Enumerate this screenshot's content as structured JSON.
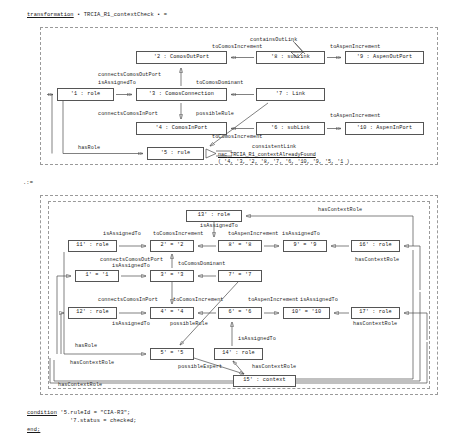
{
  "header": {
    "keyword": "transformation",
    "text": " • TRCIA_R1_contextCheck • ="
  },
  "section_marker": ".:=",
  "footer": {
    "condition_keyword": "condition",
    "condition_line1": " '5.ruleId = \"CIA-R3\";",
    "condition_line2": "'7.status = checked;",
    "end_keyword": "end;"
  },
  "lhs": {
    "nodes": [
      {
        "id": "n1",
        "label": "'1 : role"
      },
      {
        "id": "n2",
        "label": "'2 : ComosOutPort"
      },
      {
        "id": "n3",
        "label": "'3 : ComosConnection"
      },
      {
        "id": "n4",
        "label": "'4 : ComosInPort"
      },
      {
        "id": "n5",
        "label": "'5 : rule"
      },
      {
        "id": "n6",
        "label": "'6 : subLink"
      },
      {
        "id": "n7",
        "label": "'7 : Link"
      },
      {
        "id": "n8",
        "label": "'8 : subLink"
      },
      {
        "id": "n9",
        "label": "'9 : AspenOutPort"
      },
      {
        "id": "n10",
        "label": "'10 : AspenInPort"
      }
    ],
    "edges": [
      {
        "label": "containsOutLink"
      },
      {
        "label": "toComosIncrement"
      },
      {
        "label": "toAspenIncrement"
      },
      {
        "label": "connectsComosOutPort"
      },
      {
        "label": "isAssignedTo"
      },
      {
        "label": "toComosDominant"
      },
      {
        "label": "connectsComosInPort"
      },
      {
        "label": "possibleRule"
      },
      {
        "label": "toAspenIncrement"
      },
      {
        "label": "toComosIncrement"
      },
      {
        "label": "consistentLink"
      },
      {
        "label": "hasRole"
      }
    ],
    "nac": {
      "keyword": "nac",
      "name": " TRCIA_R1_contextAlreadyFound",
      "args": "( '4, '3, '2, '8, '7, '6, '10, '9, '5, '1 )"
    }
  },
  "rhs": {
    "nodes": [
      {
        "id": "m1",
        "label": "1' = '1"
      },
      {
        "id": "m2",
        "label": "2' = '2"
      },
      {
        "id": "m3",
        "label": "3' = '3"
      },
      {
        "id": "m4",
        "label": "4' = '4"
      },
      {
        "id": "m5",
        "label": "5' = '5"
      },
      {
        "id": "m6",
        "label": "6' = '6"
      },
      {
        "id": "m7",
        "label": "7' = '7"
      },
      {
        "id": "m8",
        "label": "8' = '8"
      },
      {
        "id": "m9",
        "label": "9' = '9"
      },
      {
        "id": "m10",
        "label": "10' = '10"
      },
      {
        "id": "m11",
        "label": "11' : role"
      },
      {
        "id": "m12",
        "label": "12' : role"
      },
      {
        "id": "m13",
        "label": "13' : role"
      },
      {
        "id": "m14",
        "label": "14' : role"
      },
      {
        "id": "m15",
        "label": "15' : context"
      },
      {
        "id": "m16",
        "label": "16' : role"
      },
      {
        "id": "m17",
        "label": "17' : role"
      }
    ],
    "edges": [
      {
        "label": "hasContextRole"
      },
      {
        "label": "isAssignedTo"
      },
      {
        "label": "isAssignedTo"
      },
      {
        "label": "toComosIncrement"
      },
      {
        "label": "toAspenIncrement"
      },
      {
        "label": "isAssignedTo"
      },
      {
        "label": "hasContextRole"
      },
      {
        "label": "connectsComosOutPort"
      },
      {
        "label": "isAssignedTo"
      },
      {
        "label": "toComosDominant"
      },
      {
        "label": "connectsComosInPort"
      },
      {
        "label": "toComosIncrement"
      },
      {
        "label": "toAspenIncrement"
      },
      {
        "label": "isAssignedTo"
      },
      {
        "label": "isAssignedTo"
      },
      {
        "label": "possibleRule"
      },
      {
        "label": "hasContextRole"
      },
      {
        "label": "hasRole"
      },
      {
        "label": "isAssignedTo"
      },
      {
        "label": "possibleExpert"
      },
      {
        "label": "hasContextRole"
      },
      {
        "label": "hasContextRole"
      },
      {
        "label": "hasContextRole"
      }
    ]
  },
  "colors": {
    "panel_border": "#9a9a9a",
    "node_border": "#555555",
    "wire": "#4a4a4a",
    "text": "#1a1a1a",
    "background": "#ffffff"
  }
}
